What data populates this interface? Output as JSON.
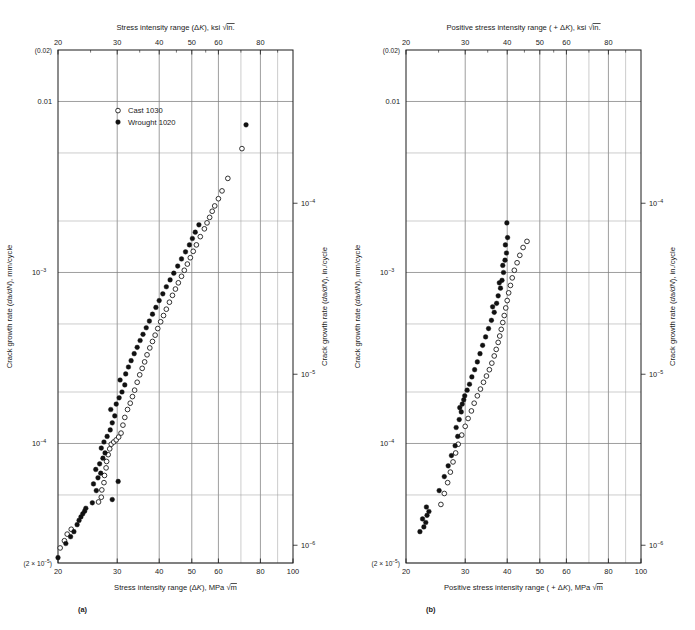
{
  "figure": {
    "panels": [
      {
        "id": "a",
        "panel_label": "(a)",
        "legend": [
          {
            "marker": "open-circle",
            "label": "Cast 1030"
          },
          {
            "marker": "filled-circle",
            "label": "Wrought 1020"
          }
        ]
      },
      {
        "id": "b",
        "panel_label": "(b)",
        "legend": []
      }
    ]
  },
  "chart_data": [
    {
      "type": "scatter",
      "panel": "a",
      "title": "",
      "xlabel": "Stress intensity range (ΔK), MPa √m",
      "xlabel_top": "Stress intensity range (ΔK), ksi √in.",
      "ylabel": "Crack growth rate (da/dN), mm/cycle",
      "ylabel_right": "Crack growth rate (da/dN), in./cycle",
      "xscale": "log",
      "yscale": "log",
      "xlim": [
        20,
        100
      ],
      "ylim": [
        2e-05,
        0.02
      ],
      "grid": true,
      "legend_position": "upper-left-inside",
      "xticks": [
        20,
        30,
        40,
        50,
        60,
        80,
        100
      ],
      "xticklabels": [
        "20",
        "30",
        "40",
        "50",
        "60",
        "80",
        "100"
      ],
      "xticks_top": [
        20,
        30,
        40,
        50,
        60,
        80
      ],
      "xticklabels_top": [
        "20",
        "30",
        "40",
        "50",
        "60",
        "80"
      ],
      "yticks": [
        0.02,
        0.01,
        0.001,
        0.0001,
        2e-05
      ],
      "yticklabels": [
        "(0.02)",
        "0.01",
        "10⁻³",
        "10⁻⁴",
        "(2 × 10⁻⁵)"
      ],
      "yticks_right": [
        0.0001,
        1e-05,
        1e-06
      ],
      "yticklabels_right": [
        "10⁻⁴",
        "10⁻⁵",
        "10⁻⁶"
      ],
      "series": [
        {
          "name": "Cast 1030",
          "marker": "open-circle",
          "points": [
            [
              20.3,
              2.45e-05
            ],
            [
              20.9,
              2.7e-05
            ],
            [
              21.3,
              2.95e-05
            ],
            [
              21.9,
              3.15e-05
            ],
            [
              26.4,
              4.55e-05
            ],
            [
              26.9,
              4.85e-05
            ],
            [
              27.0,
              5.35e-05
            ],
            [
              27.4,
              5.9e-05
            ],
            [
              27.5,
              6.5e-05
            ],
            [
              27.8,
              7.2e-05
            ],
            [
              27.9,
              7.85e-05
            ],
            [
              28.2,
              8.6e-05
            ],
            [
              28.5,
              9.3e-05
            ],
            [
              28.8,
              9.9e-05
            ],
            [
              29.3,
              0.000102
            ],
            [
              29.8,
              0.000105
            ],
            [
              30.3,
              0.000109
            ],
            [
              30.8,
              0.000115
            ],
            [
              31.2,
              0.000128
            ],
            [
              31.6,
              0.000142
            ],
            [
              32.2,
              0.000158
            ],
            [
              32.8,
              0.000172
            ],
            [
              33.3,
              0.000188
            ],
            [
              33.8,
              0.000205
            ],
            [
              34.4,
              0.000228
            ],
            [
              35.0,
              0.000252
            ],
            [
              35.6,
              0.000275
            ],
            [
              36.2,
              0.0003
            ],
            [
              36.8,
              0.00033
            ],
            [
              37.5,
              0.000362
            ],
            [
              38.2,
              0.000395
            ],
            [
              38.9,
              0.00043
            ],
            [
              39.6,
              0.00047
            ],
            [
              40.4,
              0.000515
            ],
            [
              41.2,
              0.00056
            ],
            [
              42.0,
              0.00061
            ],
            [
              42.9,
              0.00067
            ],
            [
              43.8,
              0.000735
            ],
            [
              44.7,
              0.0008
            ],
            [
              45.6,
              0.00087
            ],
            [
              46.6,
              0.00095
            ],
            [
              47.5,
              0.00103
            ],
            [
              48.5,
              0.00112
            ],
            [
              49.5,
              0.00122
            ],
            [
              50.5,
              0.00133
            ],
            [
              51.6,
              0.00145
            ],
            [
              53.0,
              0.00162
            ],
            [
              54.5,
              0.0018
            ],
            [
              55.5,
              0.00195
            ],
            [
              56.5,
              0.0021
            ],
            [
              57.5,
              0.00228
            ],
            [
              58.5,
              0.00245
            ],
            [
              60.0,
              0.0027
            ],
            [
              61.5,
              0.003
            ],
            [
              64.0,
              0.00355
            ],
            [
              70.5,
              0.0053
            ]
          ]
        },
        {
          "name": "Wrought 1020",
          "marker": "filled-circle",
          "points": [
            [
              20.0,
              2.15e-05
            ],
            [
              21.1,
              2.6e-05
            ],
            [
              21.8,
              2.85e-05
            ],
            [
              22.3,
              3.05e-05
            ],
            [
              22.8,
              3.35e-05
            ],
            [
              23.1,
              3.55e-05
            ],
            [
              23.4,
              3.72e-05
            ],
            [
              23.7,
              3.88e-05
            ],
            [
              24.0,
              4.02e-05
            ],
            [
              24.2,
              4.18e-05
            ],
            [
              25.3,
              4.5e-05
            ],
            [
              26.0,
              5.3e-05
            ],
            [
              25.5,
              5.8e-05
            ],
            [
              26.3,
              6.3e-05
            ],
            [
              26.8,
              6.7e-05
            ],
            [
              25.9,
              7.05e-05
            ],
            [
              26.6,
              7.6e-05
            ],
            [
              27.2,
              8.2e-05
            ],
            [
              27.6,
              8.8e-05
            ],
            [
              26.9,
              9.4e-05
            ],
            [
              27.4,
              0.000102
            ],
            [
              28.0,
              0.00011
            ],
            [
              28.6,
              0.00012
            ],
            [
              29.0,
              0.000132
            ],
            [
              29.5,
              0.000145
            ],
            [
              28.7,
              0.000158
            ],
            [
              29.8,
              0.00017
            ],
            [
              30.4,
              0.000185
            ],
            [
              31.0,
              0.0002
            ],
            [
              31.6,
              0.00022
            ],
            [
              30.6,
              0.000235
            ],
            [
              31.8,
              0.000255
            ],
            [
              32.4,
              0.00028
            ],
            [
              33.0,
              0.000305
            ],
            [
              33.7,
              0.000335
            ],
            [
              34.4,
              0.000365
            ],
            [
              35.1,
              0.0004
            ],
            [
              35.8,
              0.000435
            ],
            [
              36.6,
              0.000475
            ],
            [
              37.4,
              0.00052
            ],
            [
              38.2,
              0.00057
            ],
            [
              39.1,
              0.000625
            ],
            [
              40.0,
              0.000685
            ],
            [
              41.0,
              0.00075
            ],
            [
              42.0,
              0.000825
            ],
            [
              43.1,
              0.000905
            ],
            [
              44.2,
              0.00099
            ],
            [
              45.4,
              0.00109
            ],
            [
              46.6,
              0.0012
            ],
            [
              47.9,
              0.00132
            ],
            [
              49.2,
              0.00145
            ],
            [
              50.2,
              0.00158
            ],
            [
              51.2,
              0.00172
            ],
            [
              52.5,
              0.0019
            ],
            [
              29.0,
              4.7e-05
            ],
            [
              30.2,
              6e-05
            ],
            [
              72.5,
              0.0073
            ]
          ]
        }
      ]
    },
    {
      "type": "scatter",
      "panel": "b",
      "title": "",
      "xlabel": "Positive stress intensity range ( + ΔK), MPa √m",
      "xlabel_top": "Positive stress intensity range ( + ΔK), ksi √in.",
      "ylabel": "Crack growth rate (da/dN), mm/cycle",
      "ylabel_right": "Crack growth rate (da/dN), in./cycle",
      "xscale": "log",
      "yscale": "log",
      "xlim": [
        20,
        100
      ],
      "ylim": [
        2e-05,
        0.02
      ],
      "grid": true,
      "legend_position": "none",
      "xticks": [
        20,
        30,
        40,
        50,
        60,
        80,
        100
      ],
      "xticklabels": [
        "20",
        "30",
        "40",
        "50",
        "60",
        "80",
        "100"
      ],
      "xticks_top": [
        20,
        30,
        40,
        50,
        60,
        80
      ],
      "xticklabels_top": [
        "20",
        "30",
        "40",
        "50",
        "60",
        "80"
      ],
      "yticks": [
        0.02,
        0.01,
        0.001,
        0.0001,
        2e-05
      ],
      "yticklabels": [
        "(0.02)",
        "0.01",
        "10⁻³",
        "10⁻⁴",
        "(2 × 10⁻⁵)"
      ],
      "yticks_right": [
        0.0001,
        1e-05,
        1e-06
      ],
      "yticklabels_right": [
        "10⁻⁴",
        "10⁻⁵",
        "10⁻⁶"
      ],
      "series": [
        {
          "name": "Cast 1030",
          "marker": "open-circle",
          "points": [
            [
              25.4,
              4.4e-05
            ],
            [
              26.0,
              5.1e-05
            ],
            [
              26.6,
              5.9e-05
            ],
            [
              27.1,
              6.8e-05
            ],
            [
              27.6,
              7.8e-05
            ],
            [
              28.1,
              8.8e-05
            ],
            [
              28.6,
              9.9e-05
            ],
            [
              29.3,
              0.000112
            ],
            [
              30.0,
              0.000126
            ],
            [
              30.6,
              0.00014
            ],
            [
              31.3,
              0.000155
            ],
            [
              31.9,
              0.000172
            ],
            [
              32.6,
              0.00019
            ],
            [
              33.3,
              0.000208
            ],
            [
              34.0,
              0.000228
            ],
            [
              34.7,
              0.000248
            ],
            [
              35.4,
              0.00027
            ],
            [
              36.0,
              0.000295
            ],
            [
              36.6,
              0.000325
            ],
            [
              37.1,
              0.000355
            ],
            [
              37.6,
              0.00039
            ],
            [
              38.0,
              0.000425
            ],
            [
              38.4,
              0.000465
            ],
            [
              38.8,
              0.00051
            ],
            [
              39.2,
              0.00056
            ],
            [
              39.6,
              0.00062
            ],
            [
              40.0,
              0.000685
            ],
            [
              40.4,
              0.00076
            ],
            [
              40.9,
              0.00084
            ],
            [
              41.4,
              0.00093
            ],
            [
              42.0,
              0.00103
            ],
            [
              42.8,
              0.00114
            ],
            [
              43.6,
              0.00126
            ],
            [
              44.6,
              0.0014
            ],
            [
              45.8,
              0.00152
            ]
          ]
        },
        {
          "name": "Wrought 1020",
          "marker": "filled-circle",
          "points": [
            [
              22.0,
              3.05e-05
            ],
            [
              22.6,
              3.25e-05
            ],
            [
              22.9,
              3.45e-05
            ],
            [
              22.4,
              3.62e-05
            ],
            [
              23.1,
              3.8e-05
            ],
            [
              23.4,
              4e-05
            ],
            [
              23.0,
              4.25e-05
            ],
            [
              25.1,
              5.3e-05
            ],
            [
              26.0,
              6.4e-05
            ],
            [
              26.7,
              7.4e-05
            ],
            [
              27.3,
              8.5e-05
            ],
            [
              28.0,
              9.7e-05
            ],
            [
              28.5,
              0.00011
            ],
            [
              28.2,
              0.000124
            ],
            [
              28.8,
              0.000138
            ],
            [
              29.2,
              0.000153
            ],
            [
              28.9,
              0.000162
            ],
            [
              29.4,
              0.00017
            ],
            [
              29.7,
              0.00018
            ],
            [
              29.9,
              0.00019
            ],
            [
              30.4,
              0.000205
            ],
            [
              30.9,
              0.000222
            ],
            [
              31.4,
              0.000245
            ],
            [
              32.0,
              0.00027
            ],
            [
              32.6,
              0.0003
            ],
            [
              33.2,
              0.000335
            ],
            [
              33.8,
              0.000375
            ],
            [
              34.5,
              0.00042
            ],
            [
              35.2,
              0.00047
            ],
            [
              35.9,
              0.000525
            ],
            [
              36.6,
              0.000585
            ],
            [
              36.2,
              0.00063
            ],
            [
              37.2,
              0.00066
            ],
            [
              37.6,
              0.00073
            ],
            [
              38.2,
              0.00081
            ],
            [
              37.9,
              0.00087
            ],
            [
              38.6,
              0.0009
            ],
            [
              39.0,
              0.001
            ],
            [
              38.8,
              0.0011
            ],
            [
              39.4,
              0.00118
            ],
            [
              39.8,
              0.0013
            ],
            [
              39.5,
              0.00145
            ],
            [
              40.1,
              0.0016
            ],
            [
              39.9,
              0.00195
            ]
          ]
        }
      ]
    }
  ]
}
